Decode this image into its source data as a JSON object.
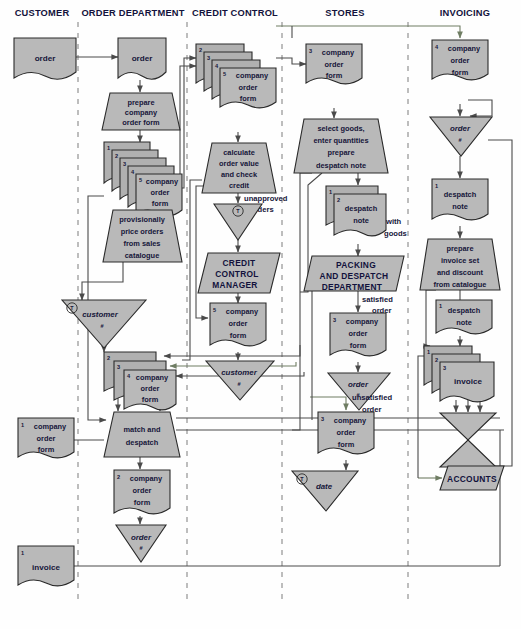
{
  "diagram": {
    "colors": {
      "shape_fill": "#b9b9b9",
      "shape_stroke": "#2a2a2a",
      "connector": "#4a4a4a",
      "connector_alt": "#6f7d63",
      "divider": "#8d8d8d",
      "header_text": "#12123c"
    },
    "columns": [
      {
        "id": "customer",
        "label": "CUSTOMER"
      },
      {
        "id": "order-department",
        "label": "ORDER DEPARTMENT"
      },
      {
        "id": "credit-control",
        "label": "CREDIT CONTROL"
      },
      {
        "id": "stores",
        "label": "STORES"
      },
      {
        "id": "invoicing",
        "label": "INVOICING"
      }
    ],
    "nodes": {
      "cust_order": {
        "text": "order"
      },
      "od_order": {
        "text": "order"
      },
      "od_prepare": {
        "line1": "prepare",
        "line2": "company",
        "line3": "order form"
      },
      "od_cof_stack1": {
        "text": "company order form",
        "l1": "company",
        "l2": "order",
        "l3": "form",
        "copies": [
          "1",
          "2",
          "3",
          "4",
          "5"
        ]
      },
      "od_price": {
        "line1": "provisionally",
        "line2": "price orders",
        "line3": "from sales",
        "line4": "catalogue"
      },
      "od_customer_file": {
        "text": "customer",
        "sub": "#",
        "marker": "T"
      },
      "od_cof_stack2": {
        "l1": "company",
        "l2": "order",
        "l3": "form",
        "copies": [
          "2",
          "3",
          "4"
        ]
      },
      "od_match": {
        "line1": "match and",
        "line2": "despatch"
      },
      "od_cof_out": {
        "num": "2",
        "l1": "company",
        "l2": "order",
        "l3": "form"
      },
      "od_order_file": {
        "text": "order",
        "sub": "#"
      },
      "cust_cof": {
        "num": "1",
        "l1": "company",
        "l2": "order",
        "l3": "form"
      },
      "cust_invoice": {
        "num": "1",
        "text": "invoice"
      },
      "cc_cof_stack": {
        "l1": "company",
        "l2": "order",
        "l3": "form",
        "copies": [
          "2",
          "3",
          "4",
          "5"
        ]
      },
      "cc_calculate": {
        "line1": "calculate",
        "line2": "order value",
        "line3": "and check",
        "line4": "credit"
      },
      "cc_unapproved": {
        "line1": "unapproved",
        "line2": "orders"
      },
      "cc_unapproved_file": {
        "marker": "T"
      },
      "cc_manager": {
        "line1": "CREDIT",
        "line2": "CONTROL",
        "line3": "MANAGER"
      },
      "cc_cof5": {
        "num": "5",
        "l1": "company",
        "l2": "order",
        "l3": "form"
      },
      "cc_customer_file": {
        "text": "customer",
        "sub": "#"
      },
      "st_cof3": {
        "num": "3",
        "l1": "company",
        "l2": "order",
        "l3": "form"
      },
      "st_select": {
        "line1": "select goods,",
        "line2": "enter quantities",
        "line3": "prepare",
        "line4": "despatch note"
      },
      "st_despatch_stack": {
        "l1": "despatch",
        "l2": "note",
        "copies": [
          "1",
          "2"
        ]
      },
      "st_with_goods": {
        "line1": "with",
        "line2": "goods"
      },
      "st_packing": {
        "line1": "PACKING",
        "line2": "AND DESPATCH",
        "line3": "DEPARTMENT"
      },
      "st_satisfied": {
        "line1": "satisfied",
        "line2": "order"
      },
      "st_cof3b": {
        "num": "3",
        "l1": "company",
        "l2": "order",
        "l3": "form"
      },
      "st_order_file": {
        "text": "order",
        "sub": "#"
      },
      "st_unsatisfied": {
        "line1": "unsatisfied",
        "line2": "order"
      },
      "st_cof3c": {
        "num": "3",
        "l1": "company",
        "l2": "order",
        "l3": "form"
      },
      "st_date_file": {
        "text": "date",
        "marker": "T"
      },
      "inv_cof4": {
        "num": "4",
        "l1": "company",
        "l2": "order",
        "l3": "form"
      },
      "inv_order_file": {
        "text": "order",
        "sub": "#"
      },
      "inv_despatch1": {
        "num": "1",
        "l1": "despatch",
        "l2": "note"
      },
      "inv_prepare": {
        "line1": "prepare",
        "line2": "invoice set",
        "line3": "and discount",
        "line4": "from catalogue"
      },
      "inv_despatch1b": {
        "num": "1",
        "l1": "despatch",
        "l2": "note"
      },
      "inv_invoice_stack": {
        "text": "invoice",
        "copies": [
          "1",
          "2",
          "3"
        ]
      },
      "inv_collate": {
        "shape": "double-triangle"
      },
      "inv_accounts": {
        "text": "ACCOUNTS"
      }
    }
  }
}
